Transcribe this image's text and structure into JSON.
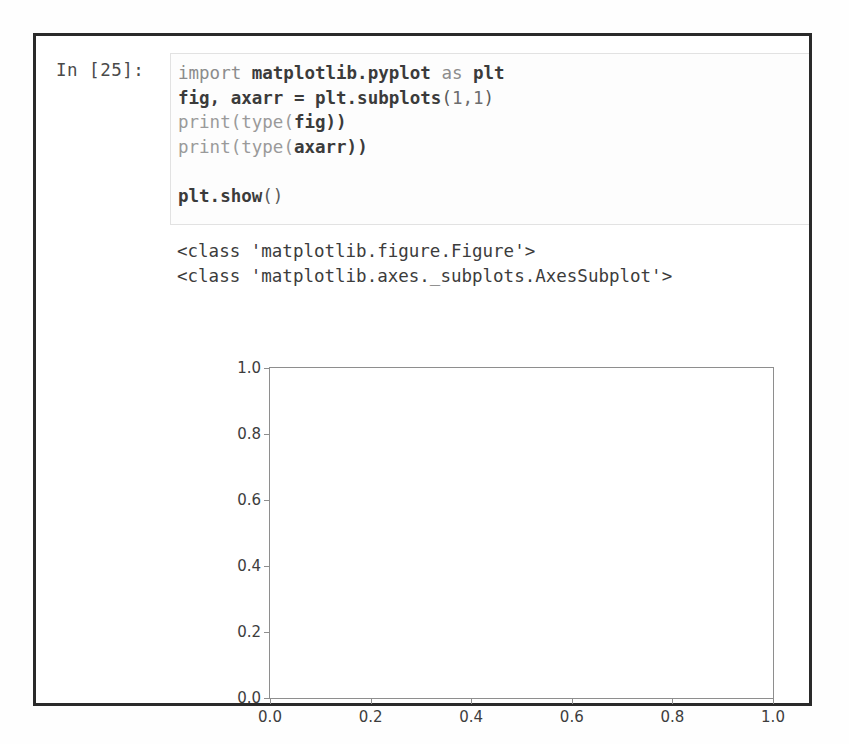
{
  "cell": {
    "prompt_label": "In [25]:",
    "code_lines": [
      [
        {
          "t": "import ",
          "c": "tok-kw"
        },
        {
          "t": "matplotlib.pyplot ",
          "c": "tok-plain"
        },
        {
          "t": "as ",
          "c": "tok-kw"
        },
        {
          "t": "plt",
          "c": "tok-plain"
        }
      ],
      [
        {
          "t": "fig, axarr = plt.subplots",
          "c": "tok-plain"
        },
        {
          "t": "(",
          "c": "tok-punct"
        },
        {
          "t": "1,1",
          "c": "tok-num"
        },
        {
          "t": ")",
          "c": "tok-punct"
        }
      ],
      [
        {
          "t": "print",
          "c": "tok-fn"
        },
        {
          "t": "(",
          "c": "tok-fn"
        },
        {
          "t": "type",
          "c": "tok-fn"
        },
        {
          "t": "(",
          "c": "tok-fn"
        },
        {
          "t": "fig))",
          "c": "tok-plain"
        }
      ],
      [
        {
          "t": "print",
          "c": "tok-fn"
        },
        {
          "t": "(",
          "c": "tok-fn"
        },
        {
          "t": "type",
          "c": "tok-fn"
        },
        {
          "t": "(",
          "c": "tok-fn"
        },
        {
          "t": "axarr))",
          "c": "tok-plain"
        }
      ],
      [],
      [
        {
          "t": "plt.show",
          "c": "tok-plain"
        },
        {
          "t": "()",
          "c": "tok-punct"
        }
      ]
    ],
    "code_plain": [
      "import matplotlib.pyplot as plt",
      "fig, axarr = plt.subplots(1,1)",
      "print(type(fig))",
      "print(type(axarr))",
      "",
      "plt.show()"
    ],
    "output_lines": [
      "<class 'matplotlib.figure.Figure'>",
      "<class 'matplotlib.axes._subplots.AxesSubplot'>"
    ]
  },
  "chart_data": {
    "type": "line",
    "title": "",
    "xlabel": "",
    "ylabel": "",
    "xlim": [
      0.0,
      1.0
    ],
    "ylim": [
      0.0,
      1.0
    ],
    "xticks": [
      0.0,
      0.2,
      0.4,
      0.6,
      0.8,
      1.0
    ],
    "yticks": [
      0.0,
      0.2,
      0.4,
      0.6,
      0.8,
      1.0
    ],
    "xtick_labels": [
      "0.0",
      "0.2",
      "0.4",
      "0.6",
      "0.8",
      "1.0"
    ],
    "ytick_labels": [
      "0.0",
      "0.2",
      "0.4",
      "0.6",
      "0.8",
      "1.0"
    ],
    "grid": false,
    "legend": null,
    "series": [],
    "note": "empty matplotlib axes created by plt.subplots(1,1); no data plotted"
  },
  "colors": {
    "cell_border": "#2a2a2a",
    "code_box_border": "#e2e2e2",
    "text": "#3c3c3c",
    "axis": "#8e8e8e",
    "background": "#ffffff"
  }
}
